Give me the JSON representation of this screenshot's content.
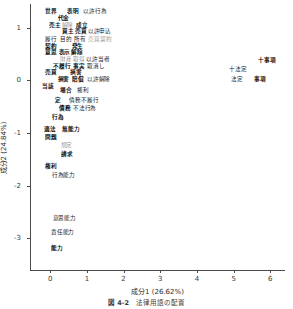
{
  "figure": {
    "caption_number": "図 4-2",
    "caption_text": "法律用語の配置"
  },
  "chart_data": {
    "type": "scatter",
    "title": "",
    "subtitle": "",
    "xlabel": "成分1 (26.62%)",
    "ylabel": "成分2 (24.84%)",
    "xlim": [
      -0.55,
      6.4
    ],
    "ylim": [
      -3.6,
      1.45
    ],
    "xticks": [
      0,
      1,
      2,
      3,
      4,
      5,
      6
    ],
    "xticklabels": [
      "0",
      "1",
      "2",
      "3",
      "4",
      "5",
      "6"
    ],
    "yticks": [
      1,
      0,
      -1,
      -2,
      -3
    ],
    "yticklabels": [
      "1",
      "0",
      "-1",
      "-2",
      "-3"
    ],
    "grid": false,
    "legend": "none",
    "marker": "text-label",
    "points": [
      {
        "label": "世界",
        "x": 0.02,
        "y": 1.32,
        "style": "bold"
      },
      {
        "label": "表明",
        "x": 0.62,
        "y": 1.32,
        "style": "bold"
      },
      {
        "label": "以許行為",
        "x": 1.22,
        "y": 1.32,
        "style": "normal"
      },
      {
        "label": "代金",
        "x": 0.36,
        "y": 1.19,
        "style": "bold"
      },
      {
        "label": "売主",
        "x": 0.12,
        "y": 1.06,
        "style": "bold"
      },
      {
        "label": "解除",
        "x": 0.47,
        "y": 1.06,
        "style": "faint"
      },
      {
        "label": "成立",
        "x": 0.86,
        "y": 1.06,
        "style": "bold"
      },
      {
        "label": "買主",
        "x": 0.48,
        "y": 0.93,
        "style": "bold"
      },
      {
        "label": "売買",
        "x": 0.84,
        "y": 0.93,
        "style": "bold"
      },
      {
        "label": "以許申込",
        "x": 1.34,
        "y": 0.93,
        "style": "normal"
      },
      {
        "label": "履行",
        "x": 0.03,
        "y": 0.79,
        "style": "normal"
      },
      {
        "label": "目的",
        "x": 0.42,
        "y": 0.79,
        "style": "normal"
      },
      {
        "label": "所有",
        "x": 0.82,
        "y": 0.79,
        "style": "normal"
      },
      {
        "label": "売買契約",
        "x": 1.36,
        "y": 0.79,
        "style": "faint"
      },
      {
        "label": "契約",
        "x": 0.03,
        "y": 0.66,
        "style": "bold"
      },
      {
        "label": "発生",
        "x": 0.74,
        "y": 0.66,
        "style": "bold"
      },
      {
        "label": "意思",
        "x": 0.03,
        "y": 0.53,
        "style": "bold"
      },
      {
        "label": "表示",
        "x": 0.39,
        "y": 0.53,
        "style": "bold"
      },
      {
        "label": "解除",
        "x": 0.73,
        "y": 0.53,
        "style": "bold"
      },
      {
        "label": "財産",
        "x": 0.42,
        "y": 0.41,
        "style": "faint"
      },
      {
        "label": "取得",
        "x": 0.78,
        "y": 0.41,
        "style": "faint"
      },
      {
        "label": "以許当者",
        "x": 1.3,
        "y": 0.41,
        "style": "normal"
      },
      {
        "label": "不履行",
        "x": 0.32,
        "y": 0.28,
        "style": "bold"
      },
      {
        "label": "事実",
        "x": 0.78,
        "y": 0.28,
        "style": "bold"
      },
      {
        "label": "取消し",
        "x": 1.24,
        "y": 0.28,
        "style": "normal"
      },
      {
        "label": "売買",
        "x": 0.01,
        "y": 0.15,
        "style": "bold"
      },
      {
        "label": "損害",
        "x": 0.71,
        "y": 0.15,
        "style": "bold"
      },
      {
        "label": "損害",
        "x": 0.36,
        "y": 0.03,
        "style": "bold"
      },
      {
        "label": "賠償",
        "x": 0.76,
        "y": 0.03,
        "style": "bold"
      },
      {
        "label": "以許解除",
        "x": 1.32,
        "y": 0.03,
        "style": "normal"
      },
      {
        "label": "当該",
        "x": -0.06,
        "y": -0.11,
        "style": "bold"
      },
      {
        "label": "場合",
        "x": 0.43,
        "y": -0.18,
        "style": "bold"
      },
      {
        "label": "権利",
        "x": 0.9,
        "y": -0.18,
        "style": "normal"
      },
      {
        "label": "定",
        "x": 0.2,
        "y": -0.37,
        "style": "bold"
      },
      {
        "label": "債務不履行",
        "x": 0.92,
        "y": -0.37,
        "style": "normal"
      },
      {
        "label": "債務",
        "x": 0.4,
        "y": -0.52,
        "style": "bold"
      },
      {
        "label": "不法行為",
        "x": 0.94,
        "y": -0.52,
        "style": "normal"
      },
      {
        "label": "行為",
        "x": 0.22,
        "y": -0.7,
        "style": "bold"
      },
      {
        "label": "適法",
        "x": 0.0,
        "y": -0.92,
        "style": "bold"
      },
      {
        "label": "無能力",
        "x": 0.56,
        "y": -0.92,
        "style": "bold"
      },
      {
        "label": "問題",
        "x": 0.02,
        "y": -1.07,
        "style": "bold"
      },
      {
        "label": "規定",
        "x": 0.44,
        "y": -1.22,
        "style": "faint"
      },
      {
        "label": "請求",
        "x": 0.46,
        "y": -1.4,
        "style": "bold"
      },
      {
        "label": "権利",
        "x": 0.02,
        "y": -1.62,
        "style": "bold"
      },
      {
        "label": "行為能力",
        "x": 0.36,
        "y": -1.8,
        "style": "normal"
      },
      {
        "label": "意思能力",
        "x": 0.38,
        "y": -2.62,
        "style": "normal"
      },
      {
        "label": "責任能力",
        "x": 0.34,
        "y": -2.88,
        "style": "normal"
      },
      {
        "label": "能力",
        "x": 0.18,
        "y": -3.18,
        "style": "bold"
      },
      {
        "label": "十事項",
        "x": 5.9,
        "y": 0.38,
        "style": "bold"
      },
      {
        "label": "十法定",
        "x": 5.12,
        "y": 0.21,
        "style": "normal"
      },
      {
        "label": "法定",
        "x": 5.1,
        "y": 0.03,
        "style": "normal"
      },
      {
        "label": "事項",
        "x": 5.72,
        "y": 0.03,
        "style": "bold"
      }
    ]
  }
}
